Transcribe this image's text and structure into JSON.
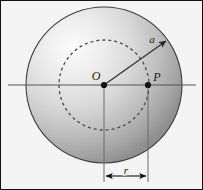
{
  "figure": {
    "kind": "physics-geometry-diagram",
    "background_color": "#f4f4f4",
    "frame_color": "#111111",
    "width": 203,
    "height": 190
  },
  "sphere": {
    "name": "shaded-sphere",
    "center_x": 104,
    "center_y": 85,
    "radius": 78,
    "outline_color": "#3a3a3a",
    "highlight_color": "#fbfbfb",
    "midtone_color": "#c9c9c9",
    "shadow_color": "#8e8e8e",
    "highlight_offset_x": "30%",
    "highlight_offset_y": "26%"
  },
  "dashed_circle": {
    "name": "dashed-radius-circle",
    "center_x": 104,
    "center_y": 85,
    "radius": 45,
    "color": "#4a4a4a",
    "dash_pattern": "3 3",
    "stroke_width": 1.3
  },
  "axis": {
    "name": "horizontal-axis-line",
    "x_start": 8,
    "x_end": 196,
    "y": 85,
    "color": "#555555",
    "stroke_width": 1.2
  },
  "points": [
    {
      "id": "O",
      "label": "O",
      "name": "center-point-o",
      "x": 104,
      "y": 85,
      "radius": 3.1,
      "label_x": 96,
      "label_y": 79,
      "color": "#111111"
    },
    {
      "id": "P",
      "label": "P",
      "name": "interior-point-p",
      "x": 148,
      "y": 85,
      "radius": 3.1,
      "label_x": 155,
      "label_y": 80,
      "color": "#111111"
    }
  ],
  "arrow": {
    "name": "radius-vector-arrow",
    "label": "a",
    "x_start": 104,
    "y_start": 85,
    "x_end": 170,
    "y_end": 38,
    "label_x": 152,
    "label_y": 40,
    "color": "#3a3a3a",
    "stroke_width": 1.3
  },
  "dimension": {
    "name": "r-dimension",
    "label": "r",
    "y": 176,
    "x_left": 104,
    "x_right": 148,
    "label_x": 126,
    "label_y": 174,
    "extension_top_o": 85,
    "extension_top_p": 85,
    "extension_bottom": 182,
    "color": "#111111",
    "extension_color": "#666666",
    "stroke_width": 1.1
  }
}
